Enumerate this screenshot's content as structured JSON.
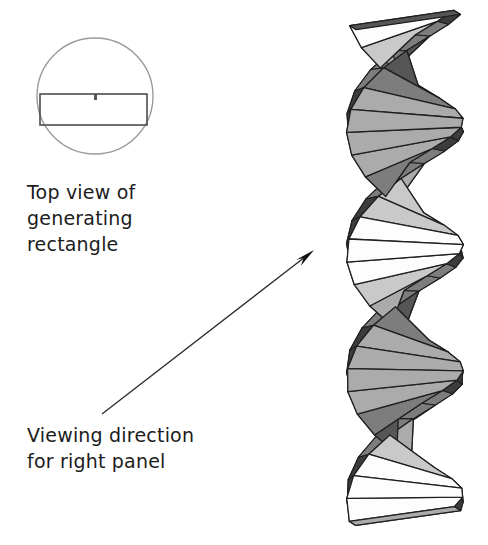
{
  "figure": {
    "background_color": "#ffffff",
    "ink_color": "#1c1c1c"
  },
  "left_panel": {
    "top_view": {
      "label": "top-view-diagram",
      "circle": {
        "cx": 95,
        "cy": 96,
        "r": 58,
        "stroke": "#9a9a9a",
        "stroke_width": 1.4,
        "fill": "none"
      },
      "rectangle": {
        "x": 40,
        "y": 94,
        "width": 107,
        "height": 31,
        "stroke": "#4d4d4d",
        "stroke_width": 1.6,
        "fill": "none"
      },
      "center_tick": {
        "x": 94,
        "y": 94,
        "width": 3,
        "height": 6,
        "fill": "#555555"
      }
    },
    "captions": {
      "top_view_text": "Top view of\ngenerating\nrectangle",
      "viewing_direction_text": "Viewing direction\nfor right panel"
    },
    "arrow": {
      "label": "viewing-direction-arrow",
      "x1": 102,
      "y1": 414,
      "x2": 314,
      "y2": 250,
      "stroke": "#2b2b2b",
      "stroke_width": 1.3,
      "head_length": 20,
      "head_width": 9,
      "head_fill": "#111111"
    }
  },
  "right_panel": {
    "label": "twisted-rectangle-helix",
    "geometry": {
      "center_x": 405,
      "top_y": 20,
      "bottom_y": 516,
      "half_width": 58,
      "slab_height": 16,
      "slabs": 31,
      "twist_per_slab_deg": 23.2,
      "start_angle_deg": 26,
      "thickness": 15,
      "perspective_tilt": 0.3
    },
    "palette": {
      "outline": "#1f1f1f",
      "outline_width": 1.3,
      "face_dark": "#565656",
      "face_mid": "#7d7d7d",
      "face_light": "#ababab",
      "face_pale": "#c9c9c9",
      "face_white": "#fdfdfd",
      "edge_dark": "#3c3c3c",
      "edge_mid": "#8e8e8e"
    }
  }
}
